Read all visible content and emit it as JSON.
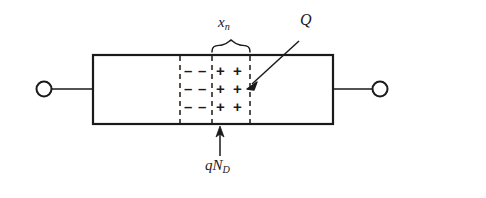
{
  "figure": {
    "background_color": "#ffffff",
    "line_color": "#1a1a1a",
    "labels": {
      "depletion_width": "x",
      "depletion_width_sub": "n",
      "charge": "Q",
      "doping_charge": "qN",
      "doping_charge_sub": "D"
    },
    "body": {
      "x": 93,
      "y": 55,
      "width": 240,
      "height": 69
    },
    "terminals": {
      "left": {
        "cx": 44,
        "cy": 89,
        "r": 8
      },
      "right": {
        "cx": 380,
        "cy": 89,
        "r": 8
      }
    },
    "dashed_lines_x": [
      180,
      212,
      250
    ],
    "charge_rows_y": [
      70,
      88,
      106
    ],
    "negative_columns_x": [
      189,
      203
    ],
    "positive_columns_x": [
      221,
      238
    ],
    "negative_sign": "–",
    "positive_sign": "+",
    "brace": {
      "x_start": 212,
      "x_end": 250,
      "y": 48
    },
    "q_arrow": {
      "x1": 299,
      "y1": 41,
      "x2": 249,
      "y2": 87
    },
    "qnd_arrow": {
      "x": 220,
      "y1": 156,
      "y2": 128
    }
  }
}
